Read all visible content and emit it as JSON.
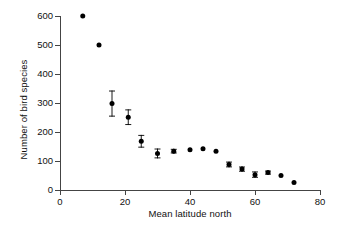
{
  "chart_data": {
    "type": "scatter",
    "title": "",
    "xlabel": "Mean latitude north",
    "ylabel": "Number of bird species",
    "xlim": [
      0,
      80
    ],
    "ylim": [
      0,
      600
    ],
    "xticks": [
      0,
      20,
      40,
      60,
      80
    ],
    "yticks": [
      0,
      100,
      200,
      300,
      400,
      500,
      600
    ],
    "xtick_labels": [
      "0",
      "20",
      "40",
      "60",
      "80"
    ],
    "ytick_labels": [
      "0",
      "100",
      "200",
      "300",
      "400",
      "500",
      "600"
    ],
    "grid": false,
    "legend": null,
    "marker": "filled-circle",
    "marker_color": "#000000",
    "errorbars": "vertical",
    "x": [
      7,
      12,
      16,
      21,
      25,
      30,
      35,
      40,
      44,
      48,
      52,
      56,
      60,
      64,
      68,
      72
    ],
    "y": [
      600,
      500,
      298,
      251,
      168,
      126,
      134,
      139,
      142,
      134,
      88,
      72,
      53,
      60,
      50,
      26
    ],
    "yerr": [
      0,
      0,
      45,
      27,
      22,
      17,
      8,
      0,
      0,
      0,
      10,
      9,
      11,
      7,
      0,
      0
    ],
    "points": [
      {
        "x": 7,
        "y": 600,
        "yerr": 0
      },
      {
        "x": 12,
        "y": 500,
        "yerr": 0
      },
      {
        "x": 16,
        "y": 298,
        "yerr": 45
      },
      {
        "x": 21,
        "y": 251,
        "yerr": 27
      },
      {
        "x": 25,
        "y": 168,
        "yerr": 22
      },
      {
        "x": 30,
        "y": 126,
        "yerr": 17
      },
      {
        "x": 35,
        "y": 134,
        "yerr": 8
      },
      {
        "x": 40,
        "y": 139,
        "yerr": 0
      },
      {
        "x": 44,
        "y": 142,
        "yerr": 0
      },
      {
        "x": 48,
        "y": 134,
        "yerr": 0
      },
      {
        "x": 52,
        "y": 88,
        "yerr": 10
      },
      {
        "x": 56,
        "y": 72,
        "yerr": 9
      },
      {
        "x": 60,
        "y": 53,
        "yerr": 11
      },
      {
        "x": 64,
        "y": 60,
        "yerr": 7
      },
      {
        "x": 68,
        "y": 50,
        "yerr": 0
      },
      {
        "x": 72,
        "y": 26,
        "yerr": 0
      }
    ]
  },
  "axes": {
    "x_title": "Mean latitude north",
    "y_title": "Number of bird species",
    "x_tick_labels": [
      "0",
      "20",
      "40",
      "60",
      "80"
    ],
    "y_tick_labels": [
      "0",
      "100",
      "200",
      "300",
      "400",
      "500",
      "600"
    ]
  },
  "colors": {
    "marker": "#000000",
    "axis": "#444444",
    "text": "#111111",
    "background": "#ffffff"
  }
}
